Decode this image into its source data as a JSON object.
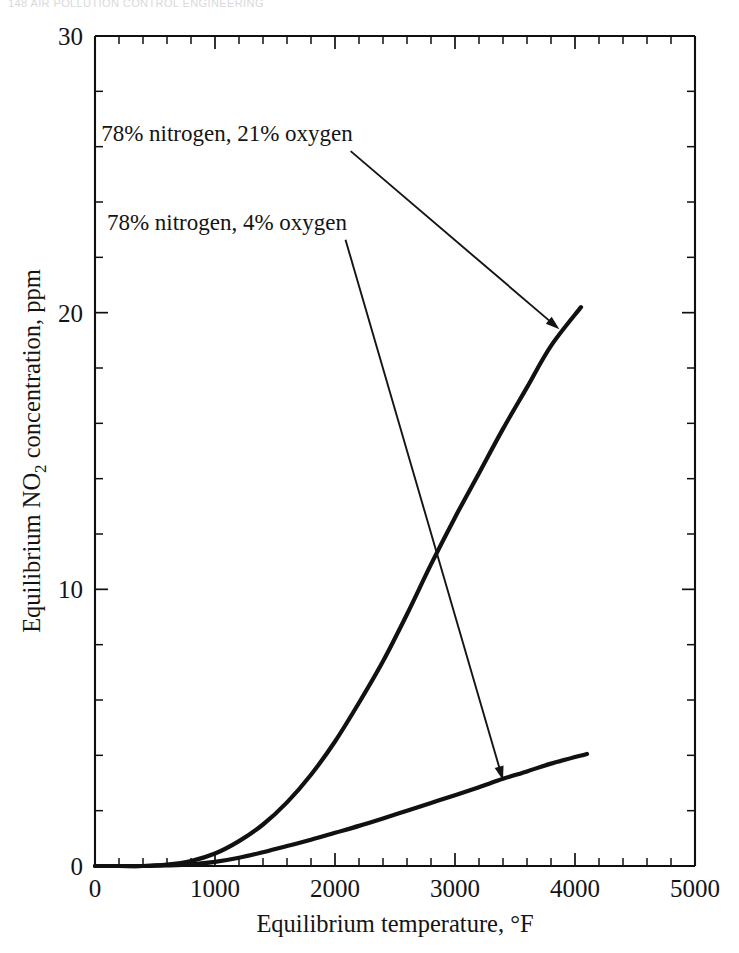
{
  "running_head": "148   AIR POLLUTION CONTROL ENGINEERING",
  "chart_data": {
    "type": "line",
    "title": "",
    "xlabel": "Equilibrium temperature, °F",
    "ylabel_prefix": "Equilibrium NO",
    "ylabel_sub": "2",
    "ylabel_suffix": " concentration, ppm",
    "ylabel_full": "Equilibrium NO2 concentration, ppm",
    "xlim": [
      0,
      5000
    ],
    "ylim": [
      0,
      30
    ],
    "xticks": [
      0,
      1000,
      2000,
      3000,
      4000,
      5000
    ],
    "xtick_labels": [
      "0",
      "1000",
      "2000",
      "3000",
      "4000",
      "5000"
    ],
    "yticks": [
      0,
      10,
      20,
      30
    ],
    "ytick_labels": [
      "0",
      "10",
      "20",
      "30"
    ],
    "x_minor_step": 200,
    "y_minor_step": 2,
    "grid": false,
    "legend_position": "inline-annotations",
    "series": [
      {
        "name": "78% nitrogen, 21% oxygen",
        "points": [
          [
            0,
            0.0
          ],
          [
            200,
            0.0
          ],
          [
            400,
            0.0
          ],
          [
            600,
            0.05
          ],
          [
            800,
            0.18
          ],
          [
            1000,
            0.45
          ],
          [
            1200,
            0.9
          ],
          [
            1400,
            1.5
          ],
          [
            1600,
            2.3
          ],
          [
            1800,
            3.3
          ],
          [
            2000,
            4.5
          ],
          [
            2200,
            5.9
          ],
          [
            2400,
            7.4
          ],
          [
            2600,
            9.1
          ],
          [
            2800,
            10.9
          ],
          [
            3000,
            12.6
          ],
          [
            3200,
            14.2
          ],
          [
            3400,
            15.8
          ],
          [
            3600,
            17.3
          ],
          [
            3800,
            18.8
          ],
          [
            4050,
            20.2
          ]
        ]
      },
      {
        "name": "78% nitrogen, 4% oxygen",
        "points": [
          [
            0,
            0.0
          ],
          [
            200,
            0.0
          ],
          [
            400,
            0.0
          ],
          [
            600,
            0.02
          ],
          [
            800,
            0.06
          ],
          [
            1000,
            0.15
          ],
          [
            1200,
            0.3
          ],
          [
            1400,
            0.5
          ],
          [
            1600,
            0.72
          ],
          [
            1800,
            0.95
          ],
          [
            2000,
            1.2
          ],
          [
            2200,
            1.45
          ],
          [
            2400,
            1.72
          ],
          [
            2600,
            2.0
          ],
          [
            2800,
            2.28
          ],
          [
            3000,
            2.56
          ],
          [
            3200,
            2.85
          ],
          [
            3400,
            3.15
          ],
          [
            3600,
            3.42
          ],
          [
            3800,
            3.7
          ],
          [
            4100,
            4.05
          ]
        ]
      }
    ],
    "annotations": [
      {
        "text": "78% nitrogen, 21% oxygen",
        "text_x": 1100,
        "text_y": 26.2,
        "target_x": 3870,
        "target_y": 19.4
      },
      {
        "text": "78% nitrogen, 4% oxygen",
        "text_x": 1100,
        "text_y": 23.0,
        "target_x": 3400,
        "target_y": 3.1
      }
    ]
  }
}
